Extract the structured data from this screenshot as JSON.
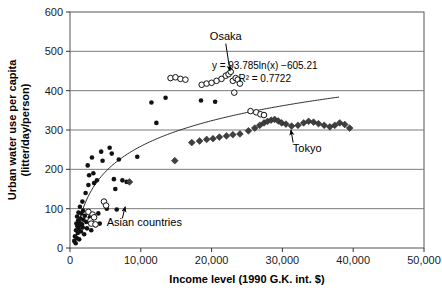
{
  "chart_data": {
    "type": "scatter",
    "title": "",
    "xlabel": "Income level (1990 G.K. int. $)",
    "ylabel": "Urban water use per capita (litter/day/person)",
    "xlim": [
      0,
      50000
    ],
    "ylim": [
      0,
      600
    ],
    "xticks": [
      0,
      10000,
      20000,
      30000,
      40000,
      50000
    ],
    "xticklabels": [
      "0",
      "10,000",
      "20,000",
      "30,000",
      "40,000",
      "50,000"
    ],
    "yticks": [
      0,
      100,
      200,
      300,
      400,
      500,
      600
    ],
    "yticklabels": [
      "0",
      "100",
      "200",
      "300",
      "400",
      "500",
      "600"
    ],
    "grid": "horizontal",
    "legend": "none",
    "annotations": [
      {
        "text": "Osaka",
        "x": 22000,
        "y": 530,
        "arrow_to_x": 22600,
        "arrow_to_y": 450
      },
      {
        "text": "Tokyo",
        "x": 33500,
        "y": 245,
        "arrow_to_x": 31200,
        "arrow_to_y": 300
      },
      {
        "text": "Asian countries",
        "x": 10500,
        "y": 55,
        "arrow_to_x": 7800,
        "arrow_to_y": 105
      }
    ],
    "fit": {
      "equation": "y = 93.785ln(x) −605.21",
      "r_squared_label": "R² = 0.7722",
      "coef_a": 93.785,
      "coef_b": -605.21,
      "r_squared": 0.7722,
      "x_start": 700,
      "x_end": 38000,
      "label_x": 27500,
      "label_y": 455
    },
    "series": [
      {
        "name": "filled-circle-series",
        "marker": "filled-circle",
        "color": "#111111",
        "points": [
          [
            600,
            18
          ],
          [
            700,
            30
          ],
          [
            800,
            12
          ],
          [
            850,
            45
          ],
          [
            900,
            62
          ],
          [
            950,
            25
          ],
          [
            1000,
            80
          ],
          [
            1050,
            55
          ],
          [
            1100,
            38
          ],
          [
            1150,
            70
          ],
          [
            1200,
            90
          ],
          [
            1250,
            48
          ],
          [
            1300,
            22
          ],
          [
            1350,
            65
          ],
          [
            1400,
            105
          ],
          [
            1450,
            58
          ],
          [
            1500,
            75
          ],
          [
            1550,
            42
          ],
          [
            1600,
            88
          ],
          [
            1700,
            60
          ],
          [
            1750,
            118
          ],
          [
            1800,
            52
          ],
          [
            1850,
            95
          ],
          [
            1900,
            72
          ],
          [
            2000,
            35
          ],
          [
            2100,
            82
          ],
          [
            2200,
            140
          ],
          [
            2300,
            66
          ],
          [
            2400,
            50
          ],
          [
            2500,
            210
          ],
          [
            2600,
            160
          ],
          [
            2700,
            185
          ],
          [
            2800,
            78
          ],
          [
            3000,
            45
          ],
          [
            3100,
            230
          ],
          [
            3300,
            190
          ],
          [
            3400,
            165
          ],
          [
            3600,
            58
          ],
          [
            3800,
            172
          ],
          [
            4000,
            88
          ],
          [
            4200,
            62
          ],
          [
            4400,
            245
          ],
          [
            4600,
            222
          ],
          [
            4900,
            115
          ],
          [
            5200,
            100
          ],
          [
            5600,
            255
          ],
          [
            5900,
            240
          ],
          [
            6200,
            175
          ],
          [
            6400,
            150
          ],
          [
            6600,
            98
          ],
          [
            6900,
            225
          ],
          [
            7400,
            172
          ],
          [
            8000,
            168
          ],
          [
            9500,
            232
          ],
          [
            11500,
            370
          ],
          [
            13500,
            382
          ],
          [
            18500,
            375
          ],
          [
            20500,
            372
          ],
          [
            12200,
            318
          ]
        ]
      },
      {
        "name": "open-circle-series",
        "marker": "open-circle",
        "color": "#111111",
        "points": [
          [
            2600,
            92
          ],
          [
            2900,
            70
          ],
          [
            3000,
            62
          ],
          [
            3200,
            85
          ],
          [
            3400,
            78
          ],
          [
            3600,
            60
          ],
          [
            4800,
            118
          ],
          [
            5100,
            108
          ],
          [
            14200,
            432
          ],
          [
            14900,
            434
          ],
          [
            15600,
            430
          ],
          [
            16300,
            428
          ],
          [
            18600,
            415
          ],
          [
            19300,
            418
          ],
          [
            20000,
            420
          ],
          [
            20700,
            425
          ],
          [
            21400,
            430
          ],
          [
            22000,
            438
          ],
          [
            22400,
            442
          ],
          [
            22700,
            448
          ],
          [
            23000,
            425
          ],
          [
            23400,
            432
          ],
          [
            23700,
            428
          ],
          [
            24000,
            418
          ],
          [
            23200,
            395
          ],
          [
            25500,
            348
          ],
          [
            26300,
            345
          ],
          [
            26900,
            340
          ],
          [
            27400,
            338
          ]
        ]
      },
      {
        "name": "diamond-series",
        "marker": "diamond",
        "color": "#3f3f3f",
        "points": [
          [
            8400,
            168
          ],
          [
            14800,
            222
          ],
          [
            17200,
            268
          ],
          [
            18300,
            272
          ],
          [
            19300,
            276
          ],
          [
            20200,
            278
          ],
          [
            21100,
            282
          ],
          [
            22100,
            285
          ],
          [
            23000,
            288
          ],
          [
            24000,
            290
          ],
          [
            25200,
            298
          ],
          [
            26100,
            305
          ],
          [
            26800,
            312
          ],
          [
            27400,
            318
          ],
          [
            27900,
            322
          ],
          [
            28400,
            325
          ],
          [
            28900,
            327
          ],
          [
            29400,
            323
          ],
          [
            29900,
            318
          ],
          [
            30500,
            315
          ],
          [
            31300,
            310
          ],
          [
            32200,
            312
          ],
          [
            33000,
            318
          ],
          [
            33700,
            322
          ],
          [
            34400,
            320
          ],
          [
            35100,
            316
          ],
          [
            35900,
            312
          ],
          [
            36700,
            308
          ],
          [
            37400,
            312
          ],
          [
            38100,
            318
          ],
          [
            38800,
            314
          ],
          [
            39500,
            305
          ]
        ]
      }
    ]
  }
}
